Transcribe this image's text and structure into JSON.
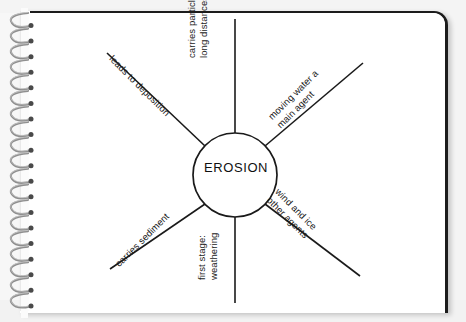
{
  "document": {
    "type": "spiral-notebook-page",
    "diagram_type": "spider-web-concept-map",
    "center_topic": "EROSION"
  },
  "colors": {
    "page_background": "#ffffff",
    "outer_background": "#f4f4f4",
    "ink": "#1a1a1a",
    "page_border": "#1c1c1c",
    "spiral_metal": "#8e8e8e",
    "spiral_dot": "#4a4a4a"
  },
  "center": {
    "label": "EROSION"
  },
  "spokes": [
    {
      "id": "top",
      "direction": "up",
      "angle_deg": -90,
      "lines": [
        "carries particles",
        "long distances"
      ]
    },
    {
      "id": "upper-left",
      "direction": "up-left",
      "angle_deg": -135,
      "lines": [
        "leads to deposition"
      ]
    },
    {
      "id": "upper-right",
      "direction": "up-right",
      "angle_deg": -45,
      "lines": [
        "moving water a",
        "main agent"
      ]
    },
    {
      "id": "lower-right",
      "direction": "down-right",
      "angle_deg": 45,
      "lines": [
        "wind and ice",
        "other agents"
      ]
    },
    {
      "id": "bottom",
      "direction": "down",
      "angle_deg": 90,
      "lines": [
        "first stage:",
        "weathering"
      ]
    },
    {
      "id": "lower-left",
      "direction": "down-left",
      "angle_deg": 135,
      "lines": [
        "carries sediment"
      ]
    }
  ],
  "labels": {
    "top_line1": "carries particles",
    "top_line2": "long distances",
    "upper_left": "leads to deposition",
    "upper_right_line1": "moving water a",
    "upper_right_line2": "main agent",
    "lower_right_line1": "wind and ice",
    "lower_right_line2": "other agents",
    "bottom_line1": "first stage:",
    "bottom_line2": "weathering",
    "lower_left": "carries sediment"
  },
  "spiral": {
    "coil_count": 19
  }
}
